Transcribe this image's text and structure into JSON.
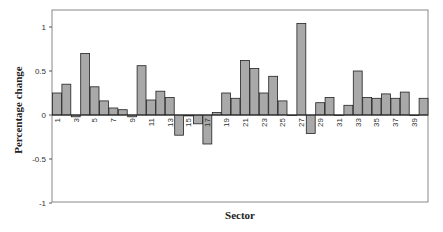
{
  "chart_data": {
    "type": "bar",
    "title": "",
    "xlabel": "Sector",
    "ylabel": "Percentage change",
    "ylim": [
      -1,
      1.2
    ],
    "yticks": [
      1,
      0.5,
      0,
      -0.5,
      -1
    ],
    "ytick_labels": [
      "1",
      "0.5",
      "0",
      "-0.5",
      "-1"
    ],
    "xtick_labels": [
      "1",
      "3",
      "5",
      "7",
      "9",
      "11",
      "13",
      "15",
      "17",
      "19",
      "21",
      "23",
      "25",
      "27",
      "29",
      "31",
      "33",
      "35",
      "37",
      "39"
    ],
    "grid": false,
    "legend": null,
    "categories": [
      1,
      2,
      3,
      4,
      5,
      6,
      7,
      8,
      9,
      10,
      11,
      12,
      13,
      14,
      15,
      16,
      17,
      18,
      19,
      20,
      21,
      22,
      23,
      24,
      25,
      26,
      27,
      28,
      29,
      30,
      31,
      32,
      33,
      34,
      35,
      36,
      37,
      38,
      39,
      40
    ],
    "values": [
      0.25,
      0.35,
      -0.02,
      0.7,
      0.32,
      0.16,
      0.08,
      0.06,
      -0.02,
      0.56,
      0.17,
      0.27,
      0.2,
      -0.23,
      -0.01,
      -0.1,
      -0.33,
      0.03,
      0.25,
      0.19,
      0.62,
      0.53,
      0.25,
      0.44,
      0.16,
      0.0,
      1.04,
      -0.21,
      0.14,
      0.2,
      0.0,
      0.11,
      0.5,
      0.2,
      0.19,
      0.24,
      0.19,
      0.26,
      0.0,
      0.19
    ],
    "bar_color": "#a9a9a9",
    "bar_edge_color": "#222222"
  }
}
